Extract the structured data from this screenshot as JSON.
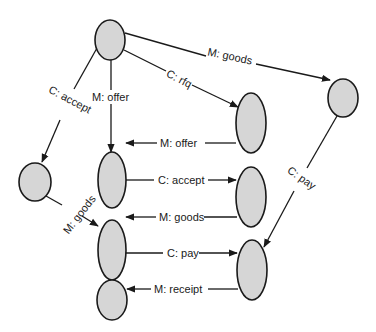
{
  "diagram": {
    "type": "message-sequence-graph",
    "nodes": [
      {
        "id": "root",
        "cx": 110,
        "cy": 40,
        "rx": 15,
        "ry": 20
      },
      {
        "id": "right-top",
        "cx": 343,
        "cy": 98,
        "rx": 15,
        "ry": 19
      },
      {
        "id": "left-small",
        "cx": 35,
        "cy": 182,
        "rx": 16,
        "ry": 19
      },
      {
        "id": "mid-upper",
        "cx": 112,
        "cy": 180,
        "rx": 14,
        "ry": 28
      },
      {
        "id": "mid-lower",
        "cx": 112,
        "cy": 250,
        "rx": 14,
        "ry": 30
      },
      {
        "id": "mid-bottom",
        "cx": 112,
        "cy": 300,
        "rx": 15,
        "ry": 20
      },
      {
        "id": "col-top",
        "cx": 251,
        "cy": 123,
        "rx": 15,
        "ry": 30
      },
      {
        "id": "col-mid",
        "cx": 251,
        "cy": 197,
        "rx": 15,
        "ry": 30
      },
      {
        "id": "col-bottom",
        "cx": 252,
        "cy": 270,
        "rx": 15,
        "ry": 30
      }
    ],
    "edges": [
      {
        "id": "e-goods-top",
        "label": "M: goods",
        "from": "root",
        "to": "right-top"
      },
      {
        "id": "e-rfq",
        "label": "C: rfq",
        "from": "root",
        "to": "col-top"
      },
      {
        "id": "e-offer-down",
        "label": "M: offer",
        "from": "root",
        "to": "mid-upper"
      },
      {
        "id": "e-accept-left",
        "label": "C: accept",
        "from": "root",
        "to": "left-small"
      },
      {
        "id": "e-offer-back",
        "label": "M: offer",
        "from": "col-top",
        "to": "mid-upper"
      },
      {
        "id": "e-accept",
        "label": "C: accept",
        "from": "mid-upper",
        "to": "col-mid"
      },
      {
        "id": "e-goods-back",
        "label": "M: goods",
        "from": "col-mid",
        "to": "mid-lower"
      },
      {
        "id": "e-goods-left",
        "label": "M: goods",
        "from": "left-small",
        "to": "mid-lower"
      },
      {
        "id": "e-pay",
        "label": "C: pay",
        "from": "mid-lower",
        "to": "col-bottom"
      },
      {
        "id": "e-pay-right",
        "label": "C: pay",
        "from": "right-top",
        "to": "col-bottom"
      },
      {
        "id": "e-receipt",
        "label": "M: receipt",
        "from": "col-bottom",
        "to": "mid-bottom"
      }
    ],
    "colors": {
      "node_fill": "#d6d6d6",
      "stroke": "#1a1a1a",
      "background": "#ffffff"
    }
  },
  "labels": {
    "goods_top": "M: goods",
    "rfq": "C: rfq",
    "offer_down": "M: offer",
    "accept_left": "C: accept",
    "offer_back": "M: offer",
    "accept": "C: accept",
    "goods_back": "M: goods",
    "goods_left": "M: goods",
    "pay": "C: pay",
    "pay_right": "C: pay",
    "receipt": "M: receipt"
  }
}
